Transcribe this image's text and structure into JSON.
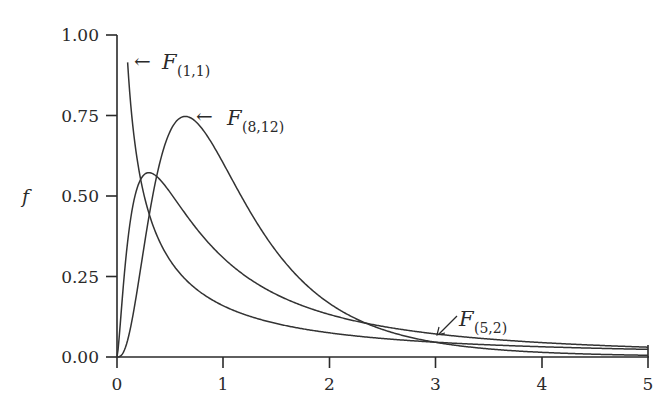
{
  "chart_data": {
    "type": "line",
    "title": "",
    "xlabel": "",
    "ylabel": "f",
    "xlim": [
      0,
      5
    ],
    "ylim": [
      0,
      1
    ],
    "grid": false,
    "legend": "inline annotations with arrows",
    "x_ticks": [
      "0",
      "1",
      "2",
      "3",
      "4",
      "5"
    ],
    "y_ticks": [
      "0.00",
      "0.25",
      "0.50",
      "0.75",
      "1.00"
    ],
    "series": [
      {
        "name": "F(1,1)",
        "label_main": "F",
        "label_sub": "(1,1)",
        "d1": 1,
        "d2": 1,
        "x_start": 0.1,
        "sample_points": [
          [
            0.1,
            0.915
          ],
          [
            0.25,
            0.509
          ],
          [
            0.5,
            0.3
          ],
          [
            1,
            0.159
          ],
          [
            2,
            0.075
          ],
          [
            3,
            0.046
          ],
          [
            4,
            0.032
          ],
          [
            5,
            0.024
          ]
        ]
      },
      {
        "name": "F(5,2)",
        "label_main": "F",
        "label_sub": "(5,2)",
        "d1": 5,
        "d2": 2,
        "x_start": 0,
        "sample_points": [
          [
            0,
            0.0
          ],
          [
            0.1,
            0.35
          ],
          [
            0.3,
            0.57
          ],
          [
            0.5,
            0.5
          ],
          [
            1,
            0.31
          ],
          [
            2,
            0.14
          ],
          [
            3,
            0.08
          ],
          [
            4,
            0.05
          ],
          [
            5,
            0.035
          ]
        ]
      },
      {
        "name": "F(8,12)",
        "label_main": "F",
        "label_sub": "(8,12)",
        "d1": 8,
        "d2": 12,
        "x_start": 0,
        "sample_points": [
          [
            0,
            0.0
          ],
          [
            0.25,
            0.29
          ],
          [
            0.5,
            0.69
          ],
          [
            0.64,
            0.74
          ],
          [
            1,
            0.59
          ],
          [
            1.5,
            0.31
          ],
          [
            2,
            0.14
          ],
          [
            3,
            0.03
          ],
          [
            4,
            0.008
          ],
          [
            5,
            0.002
          ]
        ]
      }
    ],
    "annotations": [
      {
        "target": "F(1,1)",
        "arrow": "←",
        "at": [
          0.1,
          0.91
        ]
      },
      {
        "target": "F(8,12)",
        "arrow": "←",
        "at": [
          0.75,
          0.745
        ]
      },
      {
        "target": "F(5,2)",
        "arrow": "↙",
        "at": [
          3.0,
          0.068
        ]
      }
    ]
  }
}
